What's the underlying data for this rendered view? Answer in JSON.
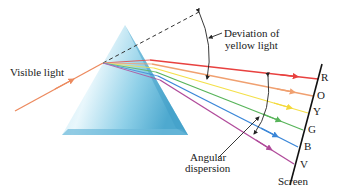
{
  "diagram": {
    "labels": {
      "incoming": "Visible light",
      "deviation_line1": "Deviation of",
      "deviation_line2": "yellow light",
      "dispersion_line1": "Angular",
      "dispersion_line2": "dispersion",
      "screen": "Screen"
    },
    "rays": [
      {
        "letter": "R",
        "color": "#e8413f"
      },
      {
        "letter": "O",
        "color": "#f0a070"
      },
      {
        "letter": "Y",
        "color": "#f4e04a"
      },
      {
        "letter": "G",
        "color": "#58b45a"
      },
      {
        "letter": "B",
        "color": "#3a86d8"
      },
      {
        "letter": "V",
        "color": "#b04a9a"
      }
    ],
    "colors": {
      "incoming_ray": "#ec8a5e",
      "prism_light": "#e8f6fb",
      "prism_dark": "#5fb4d6",
      "dashed_line": "#333333",
      "screen_line": "#111111"
    }
  }
}
